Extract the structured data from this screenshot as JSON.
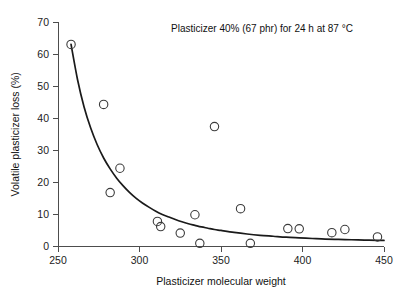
{
  "chart_data": {
    "type": "scatter",
    "title": "",
    "annotation": "Plasticizer 40% (67 phr) for 24 h at 87 °C",
    "xlabel": "Plasticizer molecular weight",
    "ylabel": "Volatile plasticizer loss (%)",
    "xlim": [
      250,
      450
    ],
    "ylim": [
      0,
      70
    ],
    "xticks": [
      250,
      300,
      350,
      400,
      450
    ],
    "yticks": [
      0,
      10,
      20,
      30,
      40,
      50,
      60,
      70
    ],
    "xtick_labels": [
      "250",
      "300",
      "350",
      "400",
      "450"
    ],
    "ytick_labels": [
      "0",
      "10",
      "20",
      "30",
      "40",
      "50",
      "60",
      "70"
    ],
    "grid": false,
    "legend": false,
    "marker": "open-circle",
    "series": [
      {
        "name": "Volatile plasticizer loss",
        "points": [
          [
            258,
            63.0
          ],
          [
            278,
            44.3
          ],
          [
            282,
            16.8
          ],
          [
            288,
            24.4
          ],
          [
            311,
            7.8
          ],
          [
            313,
            6.2
          ],
          [
            325,
            4.2
          ],
          [
            334,
            9.9
          ],
          [
            337,
            1.0
          ],
          [
            346,
            37.4
          ],
          [
            362,
            11.8
          ],
          [
            368,
            1.0
          ],
          [
            391,
            5.6
          ],
          [
            398,
            5.5
          ],
          [
            418,
            4.3
          ],
          [
            426,
            5.3
          ],
          [
            446,
            3.0
          ]
        ]
      }
    ],
    "fit_curve": {
      "name": "trend line",
      "style": "solid",
      "points": [
        [
          258,
          63.0
        ],
        [
          262,
          52.0
        ],
        [
          266,
          43.5
        ],
        [
          270,
          37.0
        ],
        [
          274,
          31.8
        ],
        [
          278,
          27.6
        ],
        [
          282,
          24.2
        ],
        [
          286,
          21.3
        ],
        [
          290,
          18.9
        ],
        [
          294,
          16.8
        ],
        [
          298,
          15.0
        ],
        [
          302,
          13.5
        ],
        [
          306,
          12.2
        ],
        [
          310,
          11.0
        ],
        [
          314,
          10.0
        ],
        [
          318,
          9.2
        ],
        [
          322,
          8.4
        ],
        [
          326,
          7.7
        ],
        [
          330,
          7.1
        ],
        [
          334,
          6.6
        ],
        [
          338,
          6.1
        ],
        [
          342,
          5.7
        ],
        [
          346,
          5.3
        ],
        [
          350,
          5.0
        ],
        [
          358,
          4.4
        ],
        [
          366,
          3.9
        ],
        [
          374,
          3.5
        ],
        [
          382,
          3.2
        ],
        [
          390,
          2.9
        ],
        [
          398,
          2.7
        ],
        [
          406,
          2.5
        ],
        [
          414,
          2.3
        ],
        [
          422,
          2.2
        ],
        [
          430,
          2.1
        ],
        [
          438,
          2.0
        ],
        [
          446,
          1.9
        ],
        [
          450,
          1.9
        ]
      ]
    }
  },
  "figure": {
    "background_color": "#ffffff",
    "axis_color": "#4d4d4d",
    "curve_color": "#1a1a1a",
    "marker_color": "#3b3b3b"
  }
}
